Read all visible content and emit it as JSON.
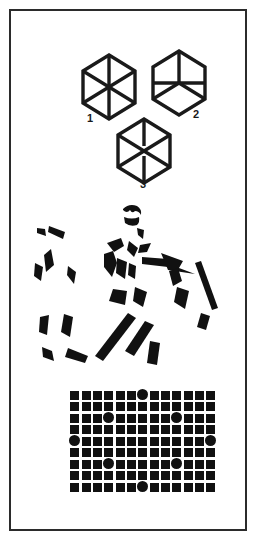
{
  "panel": {
    "title": "Gestalt perception figure panel",
    "border_color": "#2b2b2b",
    "background_color": "#ffffff",
    "ink_color": "#111111",
    "width": 256,
    "height": 540
  },
  "hexagons": {
    "section_name": "ambiguous-hexagon-figures",
    "stroke_color": "#1a1a1a",
    "items": [
      {
        "label": "1",
        "description": "hexagon with full six-spoke radial lines (vertical axis plus two diagonals)",
        "spokes": 6,
        "center_gap": false
      },
      {
        "label": "2",
        "description": "hexagon with upper vertical spoke, horizontal midline and two lower diagonal spokes",
        "spokes": 6,
        "center_gap": false
      },
      {
        "label": "3",
        "description": "hexagon with six spokes and a small break in the central vertical line",
        "spokes": 6,
        "center_gap": true
      }
    ]
  },
  "fragmented_figure": {
    "section_name": "fragmented-gestalt-figure",
    "description": "Scattered black ink blots that perceptually group into a horse and rider",
    "fill_color": "#111111",
    "blot_count": 30
  },
  "dot_grid": {
    "section_name": "square-grid-with-circles",
    "columns": 13,
    "rows": 9,
    "square_glyph": "square",
    "circle_glyph": "circle",
    "fill_color": "#111111",
    "circle_positions": [
      {
        "row": 0,
        "col": 6
      },
      {
        "row": 2,
        "col": 3
      },
      {
        "row": 2,
        "col": 9
      },
      {
        "row": 4,
        "col": 0
      },
      {
        "row": 4,
        "col": 12
      },
      {
        "row": 6,
        "col": 3
      },
      {
        "row": 6,
        "col": 9
      },
      {
        "row": 8,
        "col": 6
      }
    ],
    "circle_count": 8,
    "pattern_description": "Eight circles substituted among squares form an implicit ring"
  }
}
